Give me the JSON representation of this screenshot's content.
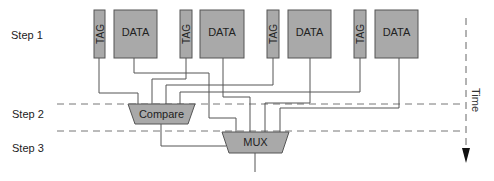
{
  "diagram": {
    "steps": [
      {
        "label": "Step 1",
        "y": 36
      },
      {
        "label": "Step 2",
        "y": 117
      },
      {
        "label": "Step 3",
        "y": 150
      }
    ],
    "ways": [
      {
        "tag": "TAG",
        "data": "DATA"
      },
      {
        "tag": "TAG",
        "data": "DATA"
      },
      {
        "tag": "TAG",
        "data": "DATA"
      },
      {
        "tag": "TAG",
        "data": "DATA"
      }
    ],
    "compare_label": "Compare",
    "mux_label": "MUX",
    "time_label": "Time",
    "colors": {
      "box_fill": "#a9a9a9",
      "box_stroke": "#555555",
      "wire": "#555555",
      "dash": "#777777",
      "arrow": "#111111"
    }
  }
}
